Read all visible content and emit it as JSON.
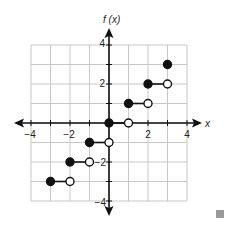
{
  "chart_data": {
    "type": "step",
    "title": "",
    "xlabel": "x",
    "ylabel": "f(x)",
    "xlim": [
      -4,
      4
    ],
    "ylim": [
      -4,
      4
    ],
    "grid": true,
    "x_ticks": [
      -4,
      -2,
      2,
      4
    ],
    "y_ticks": [
      4,
      2,
      -2,
      -4
    ],
    "segments": [
      {
        "x_start": -3,
        "x_end": -2,
        "y": -3,
        "start_closed": true,
        "end_closed": false
      },
      {
        "x_start": -2,
        "x_end": -1,
        "y": -2,
        "start_closed": true,
        "end_closed": false
      },
      {
        "x_start": -1,
        "x_end": 0,
        "y": -1,
        "start_closed": true,
        "end_closed": false
      },
      {
        "x_start": 0,
        "x_end": 1,
        "y": 0,
        "start_closed": true,
        "end_closed": false
      },
      {
        "x_start": 1,
        "x_end": 2,
        "y": 1,
        "start_closed": true,
        "end_closed": false
      },
      {
        "x_start": 2,
        "x_end": 3,
        "y": 2,
        "start_closed": true,
        "end_closed": false
      }
    ],
    "isolated_points": [
      {
        "x": 3,
        "y": 3,
        "closed": true
      }
    ]
  },
  "labels": {
    "x_axis": "x",
    "y_axis": "f (x)",
    "tick_x_neg4": "−4",
    "tick_x_neg2": "−2",
    "tick_x_2": "2",
    "tick_x_4": "4",
    "tick_y_4": "4",
    "tick_y_2": "2",
    "tick_y_neg2": "−2",
    "tick_y_neg4": "−4"
  },
  "colors": {
    "axis": "#111111",
    "grid": "#c8c8c8",
    "point": "#111111",
    "marker": "#9a9a9a"
  }
}
